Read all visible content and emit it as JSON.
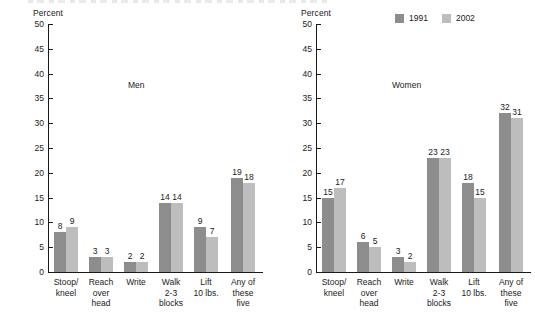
{
  "chart_data": {
    "type": "bar",
    "title": "",
    "ylabel": "Percent",
    "xlabel": "",
    "ylim": [
      0,
      50
    ],
    "yticks": [
      0,
      5,
      10,
      15,
      20,
      25,
      30,
      35,
      40,
      45,
      50
    ],
    "grid": false,
    "legend_position": "top-right",
    "legend": [
      "1991",
      "2002"
    ],
    "categories": [
      "Stoop/\nkneel",
      "Reach\nover\nhead",
      "Write",
      "Walk\n2-3\nblocks",
      "Lift\n10 lbs.",
      "Any of\nthese\nfive"
    ],
    "panels": [
      {
        "name": "Men",
        "series": [
          {
            "name": "1991",
            "color": "#8d8d8d",
            "values": [
              8,
              3,
              2,
              14,
              9,
              19
            ]
          },
          {
            "name": "2002",
            "color": "#bdbdbd",
            "values": [
              9,
              3,
              2,
              14,
              7,
              18
            ]
          }
        ]
      },
      {
        "name": "Women",
        "series": [
          {
            "name": "1991",
            "color": "#8d8d8d",
            "values": [
              15,
              6,
              3,
              23,
              18,
              32
            ]
          },
          {
            "name": "2002",
            "color": "#bdbdbd",
            "values": [
              17,
              5,
              2,
              23,
              15,
              31
            ]
          }
        ]
      }
    ]
  },
  "legend": {
    "items": [
      {
        "label": "1991",
        "color": "#8d8d8d"
      },
      {
        "label": "2002",
        "color": "#bdbdbd"
      }
    ]
  },
  "panels": {
    "men": {
      "title": "Men",
      "axis_unit": "Percent"
    },
    "women": {
      "title": "Women",
      "axis_unit": "Percent"
    }
  }
}
